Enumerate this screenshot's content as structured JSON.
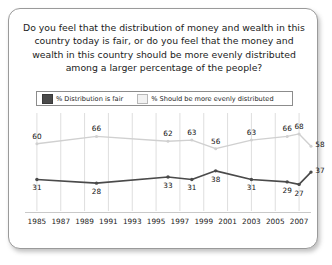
{
  "card": {
    "question_lines": [
      "Do you feel that the distribution of money and wealth in this",
      "country today is fair, or do you feel that the money and",
      "wealth in this country should be more evenly distributed",
      "among a larger percentage of the people?"
    ]
  },
  "legend": {
    "items": [
      {
        "label": "% Distribution is fair",
        "color": "#4a4a4a",
        "swatch": "dark"
      },
      {
        "label": "% Should be more evenly distributed",
        "color": "#f2f2f2",
        "swatch": "light"
      }
    ]
  },
  "chart_data": {
    "type": "line",
    "xlabel": "",
    "ylabel": "",
    "ylim": [
      0,
      100
    ],
    "grid": true,
    "legend_position": "top",
    "tick_labels": [
      "1985",
      "1987",
      "1989",
      "1991",
      "1993",
      "1995",
      "1997",
      "1999",
      "2001",
      "2003",
      "2005",
      "2007"
    ],
    "x": [
      1985,
      1990,
      1996,
      1998,
      2000,
      2003,
      2006,
      2007,
      2008
    ],
    "series": [
      {
        "name": "% Should be more evenly distributed",
        "color": "#d0d0d0",
        "values": [
          60,
          66,
          62,
          63,
          56,
          63,
          66,
          68,
          58
        ]
      },
      {
        "name": "% Distribution is fair",
        "color": "#4a4a4a",
        "values": [
          31,
          28,
          33,
          31,
          38,
          31,
          29,
          27,
          37
        ]
      }
    ]
  }
}
